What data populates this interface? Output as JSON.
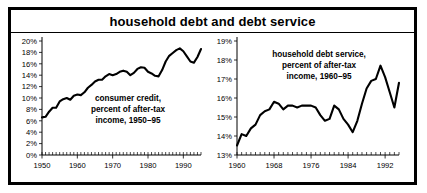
{
  "figure": {
    "title": "household debt and debt service",
    "background": "#ffffff",
    "border_color": "#000000",
    "line_color": "#000000"
  },
  "chart_data": [
    {
      "type": "line",
      "panel": "left",
      "title": "household debt and debt service",
      "annotation": "consumer credit,\npercent of  after-tax\nincome, 1950–95",
      "annotation_line1": "consumer credit,",
      "annotation_line2": "percent of  after-tax",
      "annotation_line3": "income, 1950–95",
      "xlabel": "",
      "ylabel": "",
      "xlim": [
        1950,
        1995
      ],
      "ylim": [
        0,
        20
      ],
      "grid": false,
      "legend": "none",
      "ytick_labels": [
        "0%",
        "2%",
        "4%",
        "6%",
        "8%",
        "10%",
        "12%",
        "14%",
        "16%",
        "18%",
        "20%"
      ],
      "ytick_values": [
        0,
        2,
        4,
        6,
        8,
        10,
        12,
        14,
        16,
        18,
        20
      ],
      "xtick_labels": [
        "1950",
        "1960",
        "1970",
        "1980",
        "1990"
      ],
      "xtick_values": [
        1950,
        1960,
        1970,
        1980,
        1990
      ],
      "minor_xticks_interval": 1,
      "x": [
        1950,
        1951,
        1952,
        1953,
        1954,
        1955,
        1956,
        1957,
        1958,
        1959,
        1960,
        1961,
        1962,
        1963,
        1964,
        1965,
        1966,
        1967,
        1968,
        1969,
        1970,
        1971,
        1972,
        1973,
        1974,
        1975,
        1976,
        1977,
        1978,
        1979,
        1980,
        1981,
        1982,
        1983,
        1984,
        1985,
        1986,
        1987,
        1988,
        1989,
        1990,
        1991,
        1992,
        1993,
        1994,
        1995
      ],
      "values": [
        6.6,
        6.7,
        7.6,
        8.3,
        8.3,
        9.4,
        9.8,
        10.0,
        9.7,
        10.4,
        10.6,
        10.5,
        11.0,
        11.8,
        12.3,
        12.9,
        13.2,
        13.2,
        13.8,
        14.2,
        14.0,
        14.2,
        14.6,
        14.8,
        14.6,
        14.0,
        14.4,
        15.1,
        15.4,
        15.3,
        14.6,
        14.3,
        13.9,
        13.8,
        14.9,
        16.4,
        17.4,
        17.9,
        18.4,
        18.7,
        18.2,
        17.3,
        16.4,
        16.2,
        17.2,
        18.6
      ],
      "series": [
        {
          "name": "consumer credit, percent of after-tax income",
          "values": [
            6.6,
            6.7,
            7.6,
            8.3,
            8.3,
            9.4,
            9.8,
            10.0,
            9.7,
            10.4,
            10.6,
            10.5,
            11.0,
            11.8,
            12.3,
            12.9,
            13.2,
            13.2,
            13.8,
            14.2,
            14.0,
            14.2,
            14.6,
            14.8,
            14.6,
            14.0,
            14.4,
            15.1,
            15.4,
            15.3,
            14.6,
            14.3,
            13.9,
            13.8,
            14.9,
            16.4,
            17.4,
            17.9,
            18.4,
            18.7,
            18.2,
            17.3,
            16.4,
            16.2,
            17.2,
            18.6
          ]
        }
      ]
    },
    {
      "type": "line",
      "panel": "right",
      "annotation": "household debt service,\npercent of after-tax\nincome, 1960–95",
      "annotation_line1": "household debt service,",
      "annotation_line2": "percent of after-tax",
      "annotation_line3": "income, 1960–95",
      "xlabel": "",
      "ylabel": "",
      "xlim": [
        1960,
        1995
      ],
      "ylim": [
        13,
        19
      ],
      "grid": false,
      "legend": "none",
      "ytick_labels": [
        "13%",
        "14%",
        "15%",
        "16%",
        "17%",
        "18%",
        "19%"
      ],
      "ytick_values": [
        13,
        14,
        15,
        16,
        17,
        18,
        19
      ],
      "xtick_labels": [
        "1960",
        "1968",
        "1976",
        "1984",
        "1992"
      ],
      "xtick_values": [
        1960,
        1968,
        1976,
        1984,
        1992
      ],
      "minor_xticks_interval": 1,
      "x": [
        1960,
        1961,
        1962,
        1963,
        1964,
        1965,
        1966,
        1967,
        1968,
        1969,
        1970,
        1971,
        1972,
        1973,
        1974,
        1975,
        1976,
        1977,
        1978,
        1979,
        1980,
        1981,
        1982,
        1983,
        1984,
        1985,
        1986,
        1987,
        1988,
        1989,
        1990,
        1991,
        1992,
        1993,
        1994,
        1995
      ],
      "values": [
        13.5,
        14.1,
        14.0,
        14.4,
        14.6,
        15.1,
        15.3,
        15.4,
        15.8,
        15.7,
        15.4,
        15.6,
        15.6,
        15.5,
        15.6,
        15.6,
        15.6,
        15.5,
        15.1,
        14.8,
        14.9,
        15.6,
        15.4,
        14.9,
        14.6,
        14.2,
        14.8,
        15.7,
        16.5,
        16.9,
        17.0,
        17.7,
        17.1,
        16.3,
        15.5,
        16.8
      ],
      "series": [
        {
          "name": "household debt service, percent of after-tax income",
          "values": [
            13.5,
            14.1,
            14.0,
            14.4,
            14.6,
            15.1,
            15.3,
            15.4,
            15.8,
            15.7,
            15.4,
            15.6,
            15.6,
            15.5,
            15.6,
            15.6,
            15.6,
            15.5,
            15.1,
            14.8,
            14.9,
            15.6,
            15.4,
            14.9,
            14.6,
            14.2,
            14.8,
            15.7,
            16.5,
            16.9,
            17.0,
            17.7,
            17.1,
            16.3,
            15.5,
            16.8
          ]
        }
      ]
    }
  ]
}
